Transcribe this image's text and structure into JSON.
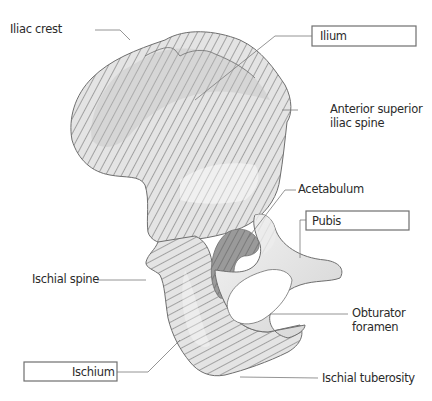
{
  "figure": {
    "colors": {
      "background": "#ffffff",
      "bone_fill": "#e6e6e6",
      "bone_shadow": "#c9c9c9",
      "bone_highlight": "#f4f4f4",
      "hatch": "#6a6a6a",
      "outline": "#6e6e6e",
      "leader": "#7a7a7a",
      "text": "#2b2b2b"
    },
    "regions": [
      {
        "name": "Ilium",
        "hatch": "diagonal-steep"
      },
      {
        "name": "Ischium",
        "hatch": "diagonal-shallow"
      },
      {
        "name": "Pubis",
        "hatch": "none"
      }
    ]
  },
  "labels": {
    "iliac_crest": "Iliac crest",
    "ilium": "Ilium",
    "asis_line1": "Anterior superior",
    "asis_line2": "iliac spine",
    "acetabulum": "Acetabulum",
    "pubis": "Pubis",
    "ischial_spine": "Ischial spine",
    "obturator_line1": "Obturator",
    "obturator_line2": "foramen",
    "ischium": "Ischium",
    "ischial_tuberosity": "Ischial tuberosity"
  }
}
